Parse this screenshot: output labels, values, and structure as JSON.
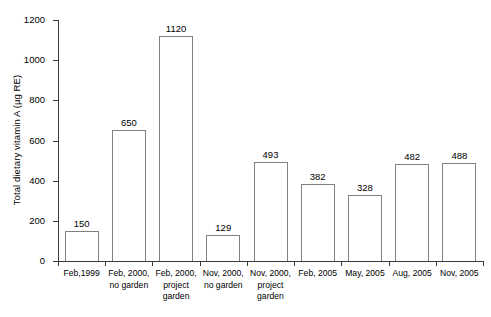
{
  "chart_data": {
    "type": "bar",
    "title": "",
    "xlabel": "",
    "ylabel": "Total dietary vitamin A (µg RE)",
    "ylim": [
      0,
      1200
    ],
    "yticks": [
      0,
      200,
      400,
      600,
      800,
      1000,
      1200
    ],
    "ytick_labels": [
      "0",
      "200",
      "400",
      "600",
      "800",
      "1000",
      "1200"
    ],
    "grid": false,
    "legend": false,
    "bar_style": {
      "fill": "#ffffff",
      "outline": "#808080"
    },
    "categories": [
      "Feb,1999",
      "Feb, 2000, no garden",
      "Feb, 2000, project garden",
      "Nov, 2000, no garden",
      "Nov, 2000, project garden",
      "Feb, 2005",
      "May, 2005",
      "Aug, 2005",
      "Nov, 2005"
    ],
    "category_lines": [
      [
        "Feb,1999"
      ],
      [
        "Feb, 2000,",
        "no garden"
      ],
      [
        "Feb, 2000,",
        "project",
        "garden"
      ],
      [
        "Nov, 2000,",
        "no garden"
      ],
      [
        "Nov, 2000,",
        "project",
        "garden"
      ],
      [
        "Feb, 2005"
      ],
      [
        "May, 2005"
      ],
      [
        "Aug, 2005"
      ],
      [
        "Nov, 2005"
      ]
    ],
    "values": [
      150,
      650,
      1120,
      129,
      493,
      382,
      328,
      482,
      488
    ],
    "value_labels": [
      "150",
      "650",
      "1120",
      "129",
      "493",
      "382",
      "328",
      "482",
      "488"
    ]
  }
}
